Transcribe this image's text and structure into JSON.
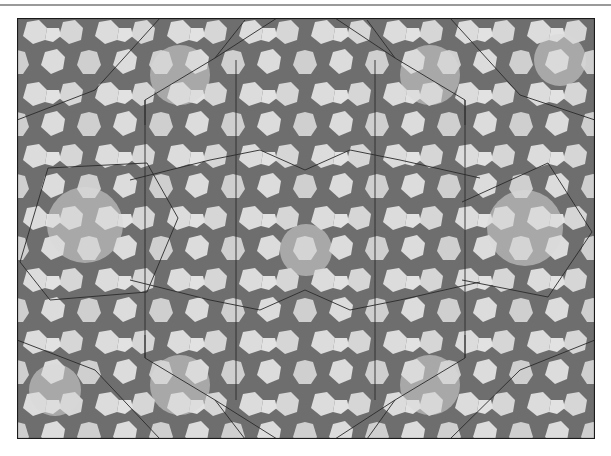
{
  "image": {
    "kind": "geometric-tiling",
    "description": "Islamic girih-style periodic pattern of light heptagon/decagon tiles on dark star interstices with thin overlaid construction lines forming large hexagons",
    "frame": {
      "x": 17,
      "y": 18,
      "width": 578,
      "height": 421
    },
    "colors": {
      "background": "#ffffff",
      "dark_fill": "#6e6e6e",
      "light_fill": "#dcdcdc",
      "light_fill_alt": "#cfcfcf",
      "frame_stroke": "#1a1a1a",
      "overlay_stroke": "#2a2a2a",
      "top_rule": "#9a9a9a"
    },
    "overlay_polylines": [
      {
        "name": "left-hexagon",
        "points": [
          [
            20,
            262
          ],
          [
            48,
            168
          ],
          [
            147,
            163
          ],
          [
            178,
            218
          ],
          [
            147,
            292
          ],
          [
            50,
            300
          ],
          [
            20,
            262
          ]
        ]
      },
      {
        "name": "right-hexagon",
        "points": [
          [
            462,
            202
          ],
          [
            548,
            163
          ],
          [
            592,
            232
          ],
          [
            548,
            297
          ],
          [
            462,
            280
          ]
        ]
      },
      {
        "name": "center-upper-left",
        "points": [
          [
            145,
            125
          ],
          [
            145,
            100
          ],
          [
            215,
            58
          ],
          [
            277,
            18
          ]
        ]
      },
      {
        "name": "center-upper-right",
        "points": [
          [
            335,
            18
          ],
          [
            395,
            58
          ],
          [
            465,
            100
          ],
          [
            465,
            125
          ]
        ]
      },
      {
        "name": "center-upper-arc",
        "points": [
          [
            130,
            180
          ],
          [
            210,
            160
          ],
          [
            260,
            150
          ],
          [
            305,
            170
          ],
          [
            350,
            150
          ],
          [
            400,
            160
          ],
          [
            480,
            178
          ]
        ]
      },
      {
        "name": "center-lower-arc",
        "points": [
          [
            130,
            280
          ],
          [
            210,
            300
          ],
          [
            260,
            310
          ],
          [
            305,
            290
          ],
          [
            350,
            310
          ],
          [
            400,
            300
          ],
          [
            480,
            282
          ]
        ]
      },
      {
        "name": "center-lower-left",
        "points": [
          [
            145,
            335
          ],
          [
            145,
            358
          ],
          [
            215,
            400
          ],
          [
            277,
            439
          ]
        ]
      },
      {
        "name": "center-lower-right",
        "points": [
          [
            335,
            439
          ],
          [
            395,
            400
          ],
          [
            465,
            358
          ],
          [
            465,
            335
          ]
        ]
      },
      {
        "name": "vertical-left-a",
        "points": [
          [
            145,
            100
          ],
          [
            145,
            358
          ]
        ]
      },
      {
        "name": "vertical-left-b",
        "points": [
          [
            236,
            60
          ],
          [
            236,
            400
          ]
        ]
      },
      {
        "name": "vertical-right-a",
        "points": [
          [
            375,
            60
          ],
          [
            375,
            400
          ]
        ]
      },
      {
        "name": "vertical-right-b",
        "points": [
          [
            465,
            100
          ],
          [
            465,
            358
          ]
        ]
      },
      {
        "name": "diag-ul",
        "points": [
          [
            215,
            58
          ],
          [
            245,
            20
          ]
        ]
      },
      {
        "name": "diag-ur",
        "points": [
          [
            395,
            58
          ],
          [
            367,
            20
          ]
        ]
      },
      {
        "name": "diag-ll",
        "points": [
          [
            215,
            400
          ],
          [
            245,
            439
          ]
        ]
      },
      {
        "name": "diag-lr",
        "points": [
          [
            395,
            400
          ],
          [
            367,
            439
          ]
        ]
      },
      {
        "name": "upper-right-slant",
        "points": [
          [
            450,
            18
          ],
          [
            520,
            95
          ],
          [
            595,
            120
          ]
        ]
      },
      {
        "name": "upper-left-slant",
        "points": [
          [
            160,
            18
          ],
          [
            95,
            90
          ],
          [
            17,
            120
          ]
        ]
      },
      {
        "name": "lower-left-slant",
        "points": [
          [
            17,
            340
          ],
          [
            95,
            370
          ],
          [
            160,
            439
          ]
        ]
      },
      {
        "name": "lower-right-slant",
        "points": [
          [
            595,
            340
          ],
          [
            520,
            370
          ],
          [
            450,
            439
          ]
        ]
      }
    ]
  }
}
